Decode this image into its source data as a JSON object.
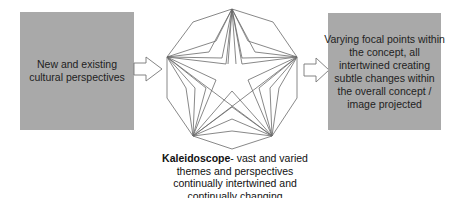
{
  "left_box": {
    "lines": [
      "New and existing",
      "cultural perspectives"
    ],
    "fill_color": "#a9a9a9"
  },
  "right_box": {
    "lines": [
      "Varying focal points within",
      "the concept, all",
      "intertwined creating",
      "subtle changes within",
      "the overall concept /",
      "image projected"
    ],
    "fill_color": "#a9a9a9"
  },
  "arrows": [
    {
      "name": "left-to-center-arrow",
      "direction": "right"
    },
    {
      "name": "center-to-right-arrow",
      "direction": "right"
    }
  ],
  "kaleidoscope": {
    "shape": "star-in-decagon",
    "stroke_color": "#666666"
  },
  "caption": {
    "title": "Kaleidoscope",
    "title_suffix": "- vast and varied",
    "lines": [
      "themes and perspectives",
      "continually intertwined and",
      "continually changing"
    ]
  }
}
